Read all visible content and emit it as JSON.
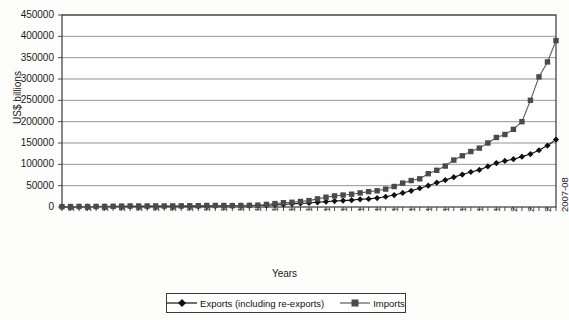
{
  "chart_data": {
    "type": "line",
    "title": "",
    "xlabel": "Years",
    "ylabel": "US$ billions",
    "ylim": [
      0,
      450000
    ],
    "ytick_labels": [
      "450000",
      "400000",
      "350000",
      "300000",
      "250000",
      "200000",
      "150000",
      "100000",
      "50000",
      "0"
    ],
    "ytick_values": [
      450000,
      400000,
      350000,
      300000,
      250000,
      200000,
      150000,
      100000,
      50000,
      0
    ],
    "grid": true,
    "legend_position": "bottom",
    "categories": [
      "1949-50",
      "1950-51",
      "1951-52",
      "1952-53",
      "1953-54",
      "1954-55",
      "1955-56",
      "1956-57",
      "1957-58",
      "1958-59",
      "1959-60",
      "1960-61",
      "1961-62",
      "1962-63",
      "1963-64",
      "1964-65",
      "1965-66",
      "1966-67",
      "1967-68",
      "1968-69",
      "1969-70",
      "1970-71",
      "1971-72",
      "1972-73",
      "1973-74",
      "1974-75",
      "1975-76",
      "1976-77",
      "1977-78",
      "1978-79",
      "1979-80",
      "1980-81",
      "1981-82",
      "1982-83",
      "1983-84",
      "1984-85",
      "1985-86",
      "1986-87",
      "1987-88",
      "1988-89",
      "1989-90",
      "1990-91",
      "1991-92",
      "1992-93",
      "1993-94",
      "1994-95",
      "1995-96",
      "1996-97",
      "1997-98",
      "1998-99",
      "1999-2000",
      "2000-01",
      "2001-02",
      "2002-03",
      "2003-04",
      "2004-05",
      "2005-06",
      "2006-07",
      "2007-08"
    ],
    "xtick_labels_shown": [
      "1949-50",
      "1951-52",
      "1953-54",
      "1955-56",
      "1957-58",
      "1959-60",
      "1961-62",
      "1963-64",
      "1965-66",
      "1967-68",
      "1969-70",
      "1971-72",
      "1973-74",
      "1975-76",
      "1977-78",
      "1979-80",
      "1981-82",
      "1983-84",
      "1985-86",
      "1987-88",
      "1989-90",
      "1991-92",
      "1993-94",
      "1995-96",
      "1997-98",
      "1999-2000",
      "2001-02",
      "2003-04",
      "2005-06",
      "2007-08"
    ],
    "series": [
      {
        "name": "Exports (including re-exports)",
        "marker": "diamond",
        "color": "#111111",
        "values": [
          485,
          601,
          714,
          602,
          531,
          591,
          609,
          605,
          561,
          581,
          640,
          642,
          660,
          685,
          793,
          816,
          806,
          1157,
          1199,
          1358,
          1413,
          1535,
          1608,
          1971,
          2523,
          3329,
          4036,
          5142,
          5408,
          5726,
          6459,
          6711,
          7806,
          8803,
          9771,
          11744,
          10895,
          12452,
          15674,
          20232,
          27658,
          32553,
          44041,
          53688,
          69751,
          82674,
          106353,
          118817,
          130100,
          139753,
          159561,
          203571,
          209018,
          255137,
          293367,
          375340,
          456418,
          571779,
          655864
        ],
        "values_displayed": [
          485,
          601,
          714,
          602,
          531,
          591,
          609,
          605,
          561,
          581,
          640,
          642,
          660,
          685,
          793,
          816,
          806,
          1157,
          1199,
          1358,
          1413,
          1535,
          1608,
          1971,
          2523,
          3329,
          4036,
          5142,
          5408,
          5726,
          6459,
          6711,
          7806,
          8803,
          9771,
          11744,
          10895,
          12452,
          15674,
          20232,
          27658,
          32553,
          44041,
          53688,
          69751,
          82674,
          106353,
          118817,
          130100,
          139753,
          159561,
          203571,
          209018,
          255137,
          293367,
          375340,
          456418,
          571779,
          655864
        ],
        "plot_values": [
          500,
          700,
          900,
          900,
          1000,
          1100,
          1200,
          1200,
          1200,
          1300,
          1400,
          1500,
          1500,
          1600,
          1800,
          1900,
          2000,
          2200,
          2400,
          2600,
          2800,
          3000,
          3200,
          3500,
          4000,
          5000,
          6000,
          7500,
          8500,
          9500,
          11000,
          12500,
          14000,
          15000,
          16000,
          18000,
          19000,
          21000,
          24000,
          28000,
          33000,
          38000,
          44000,
          50000,
          57000,
          63000,
          70000,
          76000,
          82000,
          87000,
          95000,
          103000,
          108000,
          112000,
          118000,
          124000,
          133000,
          144000,
          158000
        ],
        "final_value_read": 155000
      },
      {
        "name": "Imports",
        "marker": "square",
        "color": "#5a5a5a",
        "values": [
          617,
          650,
          890,
          702,
          592,
          700,
          774,
          1035,
          1233,
          1035,
          1099,
          1122,
          1090,
          1131,
          1223,
          1349,
          1409,
          2078,
          2008,
          1909,
          1582,
          1634,
          1825,
          1867,
          2955,
          4519,
          5265,
          5074,
          6020,
          6811,
          9143,
          12549,
          13608,
          14293,
          15832,
          17134,
          19658,
          20096,
          22244,
          28235,
          35416,
          43193,
          47851,
          63375,
          73101,
          89971,
          122678,
          138920,
          154176,
          178332,
          215237,
          230873,
          245200,
          297206,
          359108,
          501065,
          660409,
          840506,
          1012312
        ],
        "plot_values": [
          800,
          900,
          1200,
          1100,
          1200,
          1400,
          1600,
          2000,
          2400,
          2200,
          2300,
          2400,
          2300,
          2400,
          2600,
          2800,
          3000,
          3600,
          3600,
          3400,
          3200,
          3400,
          3800,
          4200,
          6000,
          8000,
          10000,
          11000,
          13000,
          15000,
          19000,
          23000,
          26000,
          28000,
          30000,
          33000,
          36000,
          38000,
          42000,
          48000,
          56000,
          62000,
          66000,
          78000,
          86000,
          96000,
          110000,
          120000,
          130000,
          138000,
          150000,
          163000,
          170000,
          182000,
          200000,
          250000,
          305000,
          340000,
          390000
        ],
        "final_value_read": 390000
      }
    ]
  },
  "legend": {
    "items": [
      {
        "label": "Exports (including re-exports)",
        "marker": "diamond"
      },
      {
        "label": "Imports",
        "marker": "square"
      }
    ]
  }
}
